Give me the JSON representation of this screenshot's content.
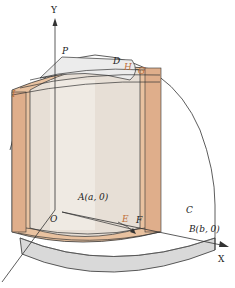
{
  "figure": {
    "colors": {
      "shell": "#e9c2a0",
      "shell_dark": "#d9a987",
      "inner_cylinder": "#e8e2da",
      "base": "#d8d8d8",
      "top": "#eeeeee",
      "line": "#333333",
      "label_orange": "#c0703a"
    },
    "labels": {
      "y_axis": "Y",
      "x_axis": "X",
      "p": "P",
      "d": "D",
      "h": "H",
      "g": "G",
      "i": "I",
      "o": "O",
      "a": "A(a, 0)",
      "e": "E",
      "f": "F",
      "c": "C",
      "b": "B(b, 0)"
    }
  }
}
